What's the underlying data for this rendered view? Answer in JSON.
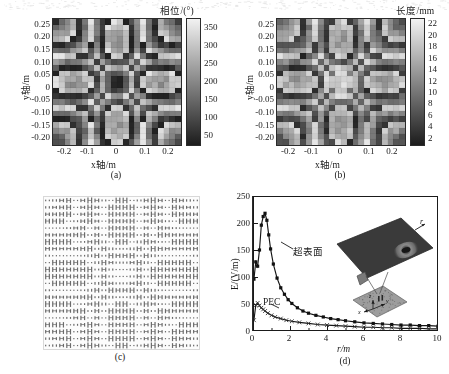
{
  "figure": {
    "background": "#ffffff",
    "ink": "#1a1a1a",
    "panels": [
      "(a)",
      "(b)",
      "(c)",
      "(d)"
    ]
  },
  "panel_a": {
    "caption": "(a)",
    "xlabel": "x轴/m",
    "ylabel": "y轴/m",
    "colorbar_title": "相位/(°)",
    "xticks": [
      "-0.2",
      "-0.1",
      "0",
      "0.1",
      "0.2"
    ],
    "yticks": [
      "0.25",
      "0.20",
      "0.15",
      "0.10",
      "0.05",
      "0",
      "-0.05",
      "-0.10",
      "-0.15",
      "-0.20"
    ],
    "cbticks": [
      "350",
      "300",
      "250",
      "200",
      "150",
      "100",
      "50"
    ],
    "chart_data": {
      "type": "heatmap",
      "title": "相位/(°)",
      "xlabel": "x轴/m",
      "ylabel": "y轴/m",
      "xlim": [
        -0.275,
        0.275
      ],
      "ylim": [
        -0.275,
        0.275
      ],
      "clim": [
        0,
        360
      ],
      "cbar_label": "相位/(°)",
      "cbar_ticks": [
        50,
        100,
        150,
        200,
        250,
        300,
        350
      ],
      "grid_cells": 22,
      "colormap": "gray",
      "pattern": "fresnel-zone-phase-wrap",
      "description": "Wrapped phase distribution of a focusing metasurface aperture; concentric square-ish Fresnel rings of phase cycling 0–360 degrees with per-cell quantization noise."
    }
  },
  "panel_b": {
    "caption": "(b)",
    "xlabel": "x轴/m",
    "ylabel": "y轴/m",
    "colorbar_title": "长度/mm",
    "xticks": [
      "-0.2",
      "-0.1",
      "0",
      "0.1",
      "0.2"
    ],
    "yticks": [
      "0.25",
      "0.20",
      "0.15",
      "0.10",
      "0.05",
      "0",
      "-0.05",
      "-0.10",
      "-0.15",
      "-0.20"
    ],
    "cbticks": [
      "22",
      "20",
      "18",
      "16",
      "14",
      "12",
      "10",
      "8",
      "6",
      "4",
      "2"
    ],
    "chart_data": {
      "type": "heatmap",
      "title": "长度/mm",
      "xlabel": "x轴/m",
      "ylabel": "y轴/m",
      "xlim": [
        -0.275,
        0.275
      ],
      "ylim": [
        -0.275,
        0.275
      ],
      "clim": [
        1,
        23
      ],
      "cbar_label": "长度/mm",
      "cbar_ticks": [
        2,
        4,
        6,
        8,
        10,
        12,
        14,
        16,
        18,
        20,
        22
      ],
      "grid_cells": 22,
      "colormap": "gray",
      "pattern": "fresnel-zone-length",
      "description": "Dipole/patch length (mm) of each unit cell mapped from the required phase; concentric rings with a bright cross-shaped plateau at the centre."
    }
  },
  "panel_c": {
    "caption": "(c)",
    "chart_data": {
      "type": "table",
      "title": "",
      "description": "Layout photograph of the fabricated metasurface: a dense 22×22 array of printed dipole unit cells of varying length arranged in concentric Fresnel zones.",
      "rows": 22,
      "cols": 22
    }
  },
  "panel_d": {
    "caption": "(d)",
    "xlabel": "r/m",
    "ylabel": "E/(V/m)",
    "xticks": [
      "0",
      "2",
      "4",
      "6",
      "8",
      "10"
    ],
    "yticks": [
      "250",
      "200",
      "150",
      "100",
      "50",
      "0"
    ],
    "series_labels": {
      "metasurface": "超表面",
      "pec": "PEC"
    },
    "inset": {
      "label_r": "r",
      "axis_x": "x",
      "axis_y": "y",
      "axis_z": "z"
    },
    "chart_data": {
      "type": "line",
      "title": "",
      "xlabel": "r/m",
      "ylabel": "E/(V/m)",
      "xlim": [
        0,
        10
      ],
      "ylim": [
        0,
        250
      ],
      "xticks": [
        0,
        2,
        4,
        6,
        8,
        10
      ],
      "yticks": [
        0,
        50,
        100,
        150,
        200,
        250
      ],
      "grid": false,
      "legend": "inline-annotations",
      "annotations": [
        "超表面",
        "PEC"
      ],
      "series": [
        {
          "name": "超表面",
          "marker": "filled-square",
          "x": [
            0.05,
            0.15,
            0.25,
            0.35,
            0.45,
            0.55,
            0.65,
            0.75,
            0.85,
            0.95,
            1.1,
            1.3,
            1.5,
            1.7,
            1.9,
            2.1,
            2.4,
            2.7,
            3.0,
            3.4,
            3.8,
            4.2,
            4.6,
            5.0,
            5.5,
            6.0,
            6.5,
            7.0,
            7.5,
            8.0,
            8.5,
            9.0,
            9.5,
            10.0
          ],
          "y": [
            96,
            128,
            120,
            150,
            196,
            212,
            218,
            205,
            178,
            152,
            124,
            98,
            80,
            68,
            58,
            51,
            43,
            37,
            33,
            29,
            26,
            23,
            21,
            19,
            17,
            15,
            14,
            13,
            12,
            11,
            11,
            10,
            10,
            9
          ]
        },
        {
          "name": "PEC",
          "marker": "cross",
          "x": [
            0.05,
            0.15,
            0.25,
            0.35,
            0.45,
            0.55,
            0.65,
            0.8,
            1.0,
            1.2,
            1.5,
            1.8,
            2.1,
            2.5,
            3.0,
            3.5,
            4.0,
            4.5,
            5.0,
            5.5,
            6.0,
            6.5,
            7.0,
            7.5,
            8.0,
            8.5,
            9.0,
            9.5,
            10.0
          ],
          "y": [
            20,
            48,
            52,
            47,
            43,
            40,
            37,
            33,
            29,
            26,
            23,
            20,
            18,
            16,
            14,
            12,
            11,
            10,
            9,
            8,
            7,
            7,
            6,
            6,
            5,
            5,
            5,
            4,
            4
          ]
        }
      ],
      "description": "Electric field magnitude versus radial distance r for the metasurface reflector (peak ≈218 V/m at r≈0.65 m) compared with a PEC reference (peak ≈52 V/m at r≈0.25 m)."
    }
  }
}
